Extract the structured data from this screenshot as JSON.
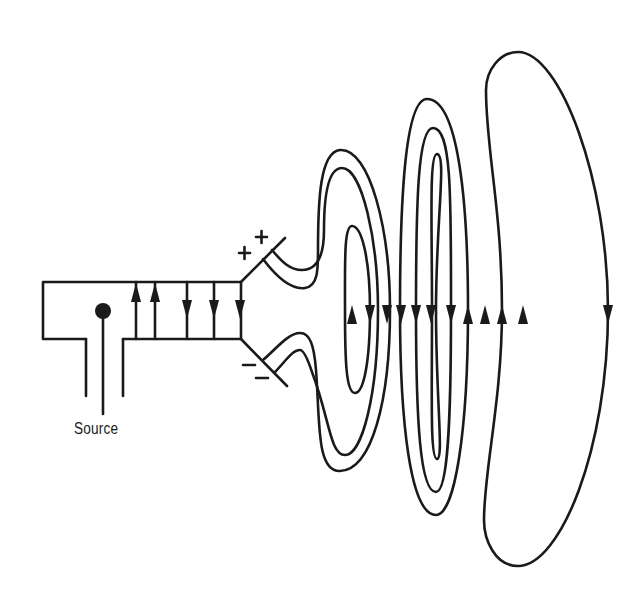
{
  "diagram": {
    "labels": {
      "source": "Source",
      "plus_sign": "+",
      "minus_sign": "−"
    },
    "components": [
      {
        "name": "waveguide",
        "description": "rectangular waveguide section with field lines"
      },
      {
        "name": "coax-source-feed",
        "description": "coaxial probe feed with dot terminal"
      },
      {
        "name": "horn-upper-plate",
        "charge": "+"
      },
      {
        "name": "horn-lower-plate",
        "charge": "−"
      },
      {
        "name": "field-loops",
        "description": "closed electric field lines detaching and propagating outward"
      }
    ],
    "waveguide_field_arrows": [
      "up",
      "up",
      "down",
      "down",
      "down"
    ],
    "radiated_field_arrows": [
      "up",
      "down",
      "down",
      "down",
      "down",
      "down",
      "down",
      "up",
      "up",
      "up",
      "up",
      "down"
    ],
    "colors": {
      "ink": "#1a1a1a",
      "background": "#ffffff"
    }
  }
}
